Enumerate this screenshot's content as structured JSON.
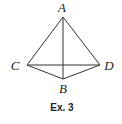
{
  "figure": {
    "caption": "Ex. 3",
    "points": {
      "A": {
        "label": "A",
        "x": 63,
        "y": 17,
        "lx": 62,
        "ly": 12
      },
      "B": {
        "label": "B",
        "x": 63,
        "y": 79,
        "lx": 63,
        "ly": 93
      },
      "C": {
        "label": "C",
        "x": 27,
        "y": 65,
        "lx": 15,
        "ly": 70
      },
      "D": {
        "label": "D",
        "x": 100,
        "y": 65,
        "lx": 109,
        "ly": 70
      }
    },
    "segments": [
      [
        "A",
        "B"
      ],
      [
        "A",
        "C"
      ],
      [
        "A",
        "D"
      ],
      [
        "C",
        "D"
      ],
      [
        "C",
        "B"
      ],
      [
        "B",
        "D"
      ]
    ],
    "stroke_color": "#333333"
  }
}
